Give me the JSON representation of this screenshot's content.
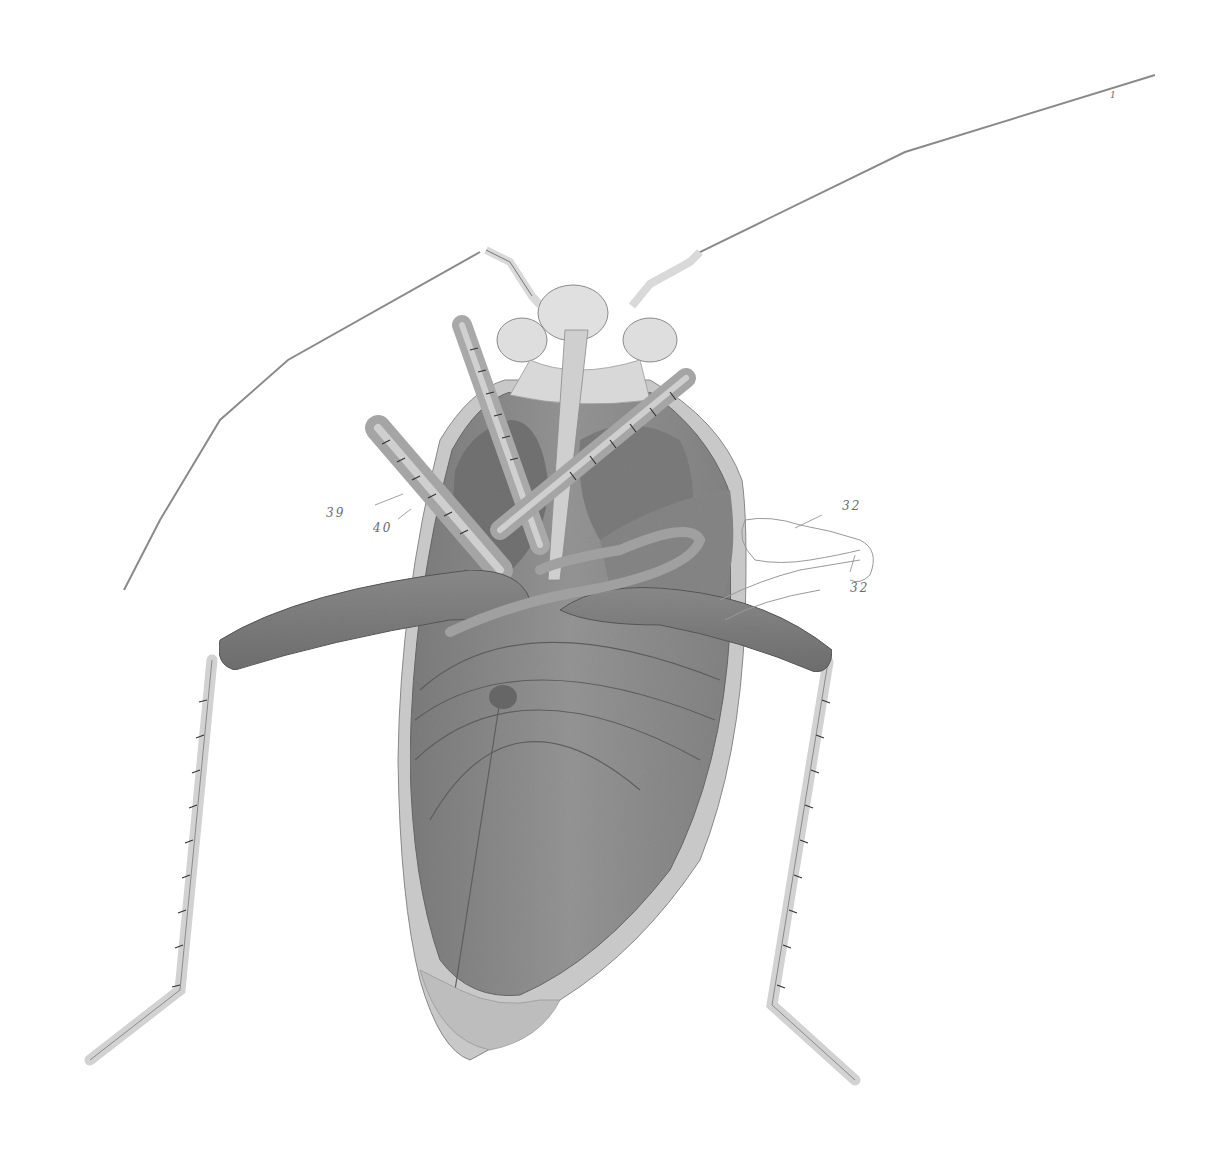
{
  "figure": {
    "palette": {
      "background": "#ffffff",
      "body_dark": "#7a7a7a",
      "body_mid": "#8e8e8e",
      "body_light": "#a9a9a9",
      "margin_pale": "#c9c9c9",
      "head_pale": "#dcdcdc",
      "leg_pale": "#d6d6d6",
      "outline": "#555555",
      "label_color": "#6b6b6b"
    },
    "labels": [
      {
        "id": "label-39",
        "text": "39",
        "x": 326,
        "y": 506
      },
      {
        "id": "label-40",
        "text": "40",
        "x": 373,
        "y": 521
      },
      {
        "id": "label-32-top",
        "text": "32",
        "x": 842,
        "y": 499
      },
      {
        "id": "label-32-bottom",
        "text": "32",
        "x": 850,
        "y": 581
      }
    ],
    "antenna_tip_mark": "1"
  }
}
